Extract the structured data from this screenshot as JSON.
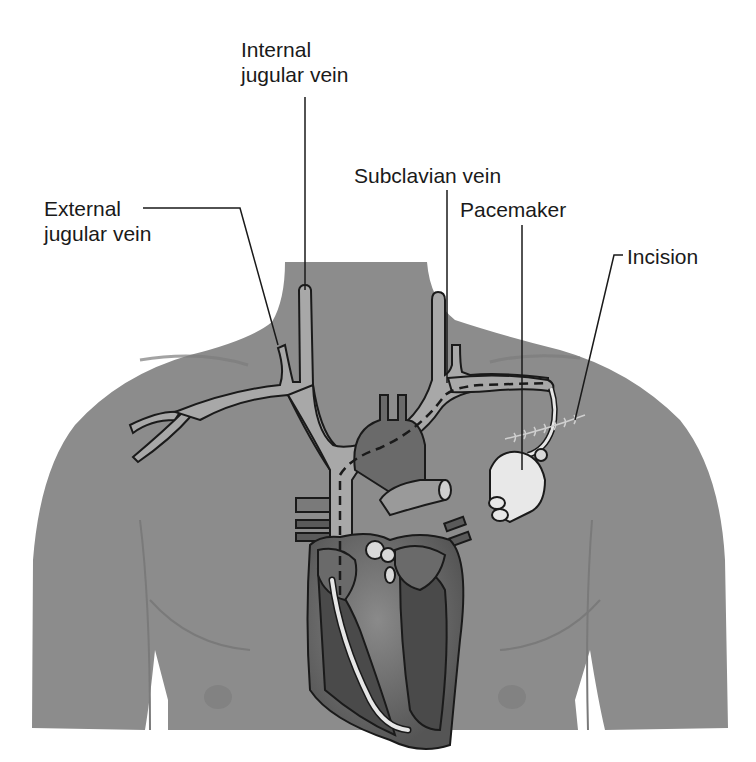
{
  "figure": {
    "colors": {
      "background": "#ffffff",
      "skin": "#8c8c8c",
      "skin_shadow": "#7a7a7a",
      "vein_fill": "#a6a6a6",
      "heart_dark": "#5a5a5a",
      "heart_mid": "#6e6e6e",
      "heart_light": "#8a8a8a",
      "lead": "#e6e6e6",
      "pacemaker": "#e8e8e8",
      "outline": "#1a1a1a",
      "label_text": "#1a1a1a"
    }
  },
  "labels": {
    "internal_jugular": {
      "line1": "Internal",
      "line2": "jugular vein"
    },
    "external_jugular": {
      "line1": "External",
      "line2": "jugular vein"
    },
    "subclavian": {
      "text": "Subclavian vein"
    },
    "pacemaker": {
      "text": "Pacemaker"
    },
    "incision": {
      "text": "Incision"
    }
  }
}
